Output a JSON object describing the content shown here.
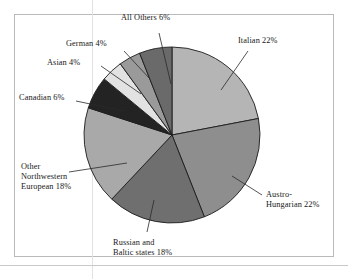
{
  "figure": {
    "background_color": "#ffffff",
    "frame_color": "#b9b9b9",
    "leader_line_color": "#2a2a2a",
    "slice_outline_color": "#1c1c1c"
  },
  "chart_data": {
    "type": "pie",
    "title": "",
    "subtitle": "",
    "xlabel": "",
    "ylabel": "",
    "grid": false,
    "legend_position": "none",
    "label_style": "external-with-leader-lines",
    "start_angle_deg": 0,
    "direction": "clockwise",
    "units": "percent",
    "total": 100,
    "categories": [
      "Italian",
      "Austro-Hungarian",
      "Russian and Baltic states",
      "Other Northwestern European",
      "Canadian",
      "Asian",
      "German",
      "All Others"
    ],
    "values": [
      22,
      22,
      18,
      18,
      6,
      4,
      4,
      6
    ],
    "colors": [
      "#b5b5b5",
      "#8e8e8e",
      "#6f6f6f",
      "#a9a9a9",
      "#232323",
      "#e2e2e2",
      "#9a9a9a",
      "#6a6a6a"
    ],
    "slices": [
      {
        "name": "Italian",
        "value": 22,
        "label": "Italian 22%",
        "color": "#b5b5b5"
      },
      {
        "name": "Austro-Hungarian",
        "value": 22,
        "label": "Austro-Hungarian 22%",
        "color": "#8e8e8e"
      },
      {
        "name": "Russian and Baltic states",
        "value": 18,
        "label": "Russian and Baltic states 18%",
        "color": "#6f6f6f"
      },
      {
        "name": "Other Northwestern European",
        "value": 18,
        "label": "Other Northwestern European 18%",
        "color": "#a9a9a9"
      },
      {
        "name": "Canadian",
        "value": 6,
        "label": "Canadian 6%",
        "color": "#232323"
      },
      {
        "name": "Asian",
        "value": 4,
        "label": "Asian 4%",
        "color": "#e2e2e2"
      },
      {
        "name": "German",
        "value": 4,
        "label": "German 4%",
        "color": "#9a9a9a"
      },
      {
        "name": "All Others",
        "value": 6,
        "label": "All Others 6%",
        "color": "#6a6a6a"
      }
    ]
  },
  "labels": {
    "italian": "Italian 22%",
    "austro_line1": "Austro-",
    "austro_line2": "Hungarian 22%",
    "russian_line1": "Russian and",
    "russian_line2": "Baltic states 18%",
    "other_nw_line1": "Other",
    "other_nw_line2": "Northwestern",
    "other_nw_line3": "European 18%",
    "canadian": "Canadian 6%",
    "asian": "Asian 4%",
    "german": "German 4%",
    "all_others": "All Others 6%"
  }
}
